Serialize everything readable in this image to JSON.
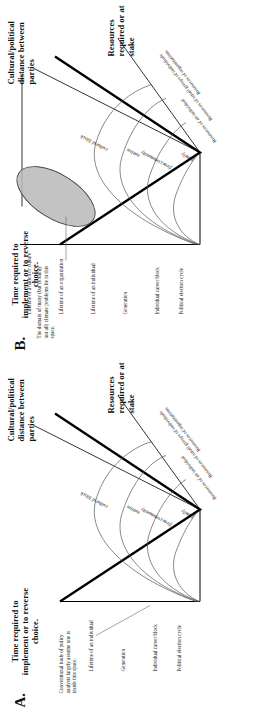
{
  "figure": {
    "orientation": "rotated-90",
    "panels": [
      {
        "letter": "A.",
        "y_axis_title": "Time required to implement or to reverse choice.",
        "x_axis_title_left": "Cultural/political distance between parties",
        "x_axis_title_right": "Resources required or at stake",
        "y_ticks": [
          "Political election cycle",
          "Individual career block",
          "Generation",
          "Lifetime of an individual"
        ],
        "x_ticks_left": [
          "family",
          "firm/community",
          "nation",
          "cultural block"
        ],
        "x_ticks_right": [
          "Resources of an individual",
          "Resources of small groups of individuals",
          "Resources of organizations"
        ],
        "callout": "Conventional tools of policy analysis largely assume one is inside this space.",
        "has_ellipse": false
      },
      {
        "letter": "B.",
        "y_axis_title": "Time required to implement or to reverse choice.",
        "x_axis_title_left": "Cultural/political distance between parties",
        "x_axis_title_right": "Resources required or at stake",
        "y_ticks": [
          "Political election cycle",
          "Individual career block",
          "Generation",
          "Lifetime of an individual",
          "Lifetime of an organization",
          "Lifetime of a nation or culture"
        ],
        "x_ticks_left": [
          "family",
          "firm/community",
          "nation",
          "cultural block"
        ],
        "x_ticks_right": [
          "Resources of an individual",
          "Resources of small groups of individuals",
          "Resources of organizations"
        ],
        "callout": "The domain of many (but certainly not all) climate problems lie in this space.",
        "has_ellipse": true,
        "ellipse_label": "climate-problem-domain"
      }
    ],
    "colors": {
      "ink": "#111111",
      "ellipse_fill": "#b9b9b9",
      "ellipse_stroke": "#444444",
      "curve_stroke": "#555555",
      "axis_stroke": "#000000"
    }
  }
}
